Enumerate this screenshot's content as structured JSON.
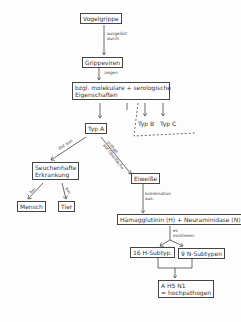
{
  "diagram": {
    "nodes": {
      "vogelgrippe": "Vogelgrippe",
      "grippeviren": "Grippeviren",
      "eigenschaften_line1": "bzgl. molekulare + serologische",
      "eigenschaften_line2": "Eigenschaften",
      "typ_a": "Typ A",
      "typ_b": "Typ B",
      "typ_c": "Typ C",
      "seuchenhafte_line1": "Seuchenhafte",
      "seuchenhafte_line2": "Erkrankung",
      "mensch": "Mensch",
      "tier": "Tier",
      "eiweisse": "Eiweiße",
      "haemagglutinin": "Hämagglutinin (H) + Neuraminidase (N)",
      "h_subtypen": "16 H-Subtyp.",
      "n_subtypen": "9 N-Subtypen",
      "result_line1": "A H5 N1",
      "result_line2": "= hochpathogen"
    },
    "edge_labels": {
      "ausgeloest_line1": "ausgelöst",
      "ausgeloest_line2": "durch",
      "zeigen": "zeigen",
      "loest_aus": "löst aus",
      "enthaelt_line1": "enthält",
      "enthaelt_line2": "auf Oberfläche",
      "bei_mensch": "bei",
      "bei_tier": "bei",
      "kombination_line1": "kombination",
      "kombination_line2": "aus:",
      "es_line1": "es",
      "es_line2": "existieren:"
    }
  }
}
